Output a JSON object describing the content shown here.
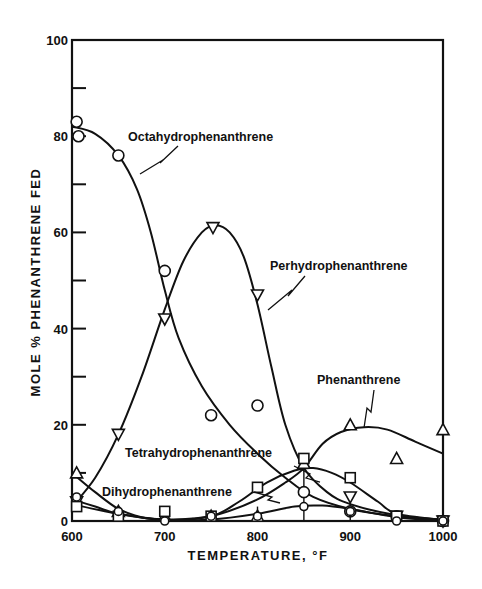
{
  "chart_data": {
    "type": "line",
    "title": "",
    "xlabel": "TEMPERATURE, °F",
    "ylabel": "MOLE % PHENANTHRENE FED",
    "xlim": [
      600,
      1000
    ],
    "ylim": [
      0,
      100
    ],
    "x_ticks": [
      600,
      700,
      800,
      900,
      1000
    ],
    "y_ticks": [
      0,
      20,
      40,
      60,
      80,
      100
    ],
    "y_minor_ticks": [
      10,
      30,
      50,
      70,
      90
    ],
    "x_minor_ticks": [
      650,
      750,
      850,
      950
    ],
    "grid": false,
    "legend": "inline annotations",
    "series": [
      {
        "name": "Octahydrophenanthrene",
        "marker": "circle",
        "points": [
          [
            605,
            83
          ],
          [
            607,
            80
          ],
          [
            650,
            76
          ],
          [
            700,
            52
          ],
          [
            750,
            22
          ],
          [
            800,
            24
          ],
          [
            850,
            6
          ],
          [
            900,
            2
          ],
          [
            950,
            1
          ],
          [
            1000,
            0
          ]
        ],
        "curve": [
          [
            600,
            82
          ],
          [
            625,
            80.5
          ],
          [
            650,
            76
          ],
          [
            670,
            69
          ],
          [
            685,
            60
          ],
          [
            700,
            48
          ],
          [
            715,
            38
          ],
          [
            740,
            28
          ],
          [
            770,
            20
          ],
          [
            800,
            14
          ],
          [
            830,
            9
          ],
          [
            860,
            5
          ],
          [
            900,
            2.5
          ],
          [
            950,
            1
          ],
          [
            1000,
            0.3
          ]
        ]
      },
      {
        "name": "Perhydrophenanthrene",
        "marker": "triangle-down",
        "points": [
          [
            605,
            4
          ],
          [
            650,
            18
          ],
          [
            700,
            42
          ],
          [
            752,
            61
          ],
          [
            800,
            47
          ],
          [
            900,
            5
          ],
          [
            950,
            1
          ],
          [
            1000,
            0
          ]
        ],
        "curve": [
          [
            600,
            3
          ],
          [
            625,
            9
          ],
          [
            650,
            18
          ],
          [
            675,
            30
          ],
          [
            700,
            44
          ],
          [
            720,
            54
          ],
          [
            740,
            60
          ],
          [
            755,
            61.5
          ],
          [
            770,
            60
          ],
          [
            785,
            55
          ],
          [
            800,
            45
          ],
          [
            815,
            32
          ],
          [
            830,
            20
          ],
          [
            850,
            11
          ],
          [
            875,
            6
          ],
          [
            900,
            3.5
          ],
          [
            950,
            1.2
          ],
          [
            1000,
            0.2
          ]
        ]
      },
      {
        "name": "Phenanthrene",
        "marker": "triangle-up",
        "points": [
          [
            605,
            10
          ],
          [
            650,
            2
          ],
          [
            700,
            1
          ],
          [
            750,
            1
          ],
          [
            800,
            1
          ],
          [
            850,
            12
          ],
          [
            900,
            20
          ],
          [
            950,
            13
          ],
          [
            1000,
            19
          ]
        ],
        "curve": [
          [
            600,
            10
          ],
          [
            625,
            6
          ],
          [
            650,
            2.5
          ],
          [
            675,
            0.8
          ],
          [
            700,
            0.3
          ],
          [
            730,
            0.5
          ],
          [
            760,
            1.5
          ],
          [
            800,
            4.5
          ],
          [
            830,
            8
          ],
          [
            850,
            11
          ],
          [
            870,
            16
          ],
          [
            890,
            18.5
          ],
          [
            915,
            19.5
          ],
          [
            940,
            19
          ],
          [
            970,
            16.5
          ],
          [
            1000,
            14
          ]
        ]
      },
      {
        "name": "Tetrahydrophenanthrene",
        "marker": "square",
        "points": [
          [
            605,
            3
          ],
          [
            650,
            1
          ],
          [
            700,
            2
          ],
          [
            750,
            1
          ],
          [
            800,
            7
          ],
          [
            850,
            13
          ],
          [
            900,
            9
          ],
          [
            950,
            1
          ],
          [
            1000,
            0
          ]
        ],
        "curve": [
          [
            600,
            3.5
          ],
          [
            650,
            1.5
          ],
          [
            700,
            0.3
          ],
          [
            750,
            1
          ],
          [
            780,
            4
          ],
          [
            810,
            8
          ],
          [
            840,
            10.5
          ],
          [
            860,
            11
          ],
          [
            880,
            10
          ],
          [
            900,
            8
          ],
          [
            930,
            4
          ],
          [
            950,
            1.5
          ],
          [
            1000,
            0.2
          ]
        ]
      },
      {
        "name": "Dihydrophenanthrene",
        "marker": "circle-small",
        "points": [
          [
            605,
            5
          ],
          [
            650,
            2
          ],
          [
            700,
            0
          ],
          [
            750,
            1
          ],
          [
            800,
            1
          ],
          [
            850,
            3
          ],
          [
            900,
            2
          ],
          [
            950,
            0
          ],
          [
            1000,
            0
          ]
        ],
        "curve": [
          [
            600,
            4.5
          ],
          [
            625,
            3
          ],
          [
            650,
            1.5
          ],
          [
            700,
            0.2
          ],
          [
            750,
            0.3
          ],
          [
            800,
            1.5
          ],
          [
            840,
            3
          ],
          [
            870,
            3.2
          ],
          [
            900,
            2.5
          ],
          [
            950,
            0.8
          ],
          [
            1000,
            0.1
          ]
        ]
      }
    ],
    "annotations": [
      {
        "text": "Octahydrophenanthrene",
        "x": 690,
        "y": 81
      },
      {
        "text": "Perhydrophenanthrene",
        "x": 830,
        "y": 53
      },
      {
        "text": "Phenanthrene",
        "x": 875,
        "y": 29
      },
      {
        "text": "Tetrahydrophenanthrene",
        "x": 715,
        "y": 14
      },
      {
        "text": "Dihydrophenanthrene",
        "x": 635,
        "y": 6
      }
    ]
  }
}
